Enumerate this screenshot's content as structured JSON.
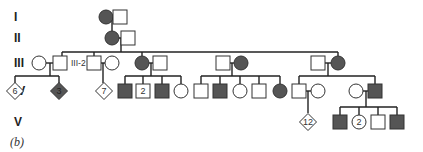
{
  "figure": {
    "panel_label": "(b)",
    "colors": {
      "affected": "#555555",
      "unaffected": "#ffffff",
      "stroke": "#333333",
      "line": "#222222"
    },
    "generations": [
      {
        "label": "I",
        "y": 17
      },
      {
        "label": "II",
        "y": 38
      },
      {
        "label": "III",
        "y": 63
      },
      {
        "label": "IV",
        "y": 91
      },
      {
        "label": "V",
        "y": 122
      }
    ],
    "individuals": [
      {
        "id": "I-1",
        "sex": "female",
        "affected": true,
        "x": 106,
        "y": 17
      },
      {
        "id": "I-2",
        "sex": "male",
        "affected": false,
        "x": 120,
        "y": 17
      },
      {
        "id": "II-1",
        "sex": "female",
        "affected": true,
        "x": 112,
        "y": 38
      },
      {
        "id": "II-2",
        "sex": "male",
        "affected": false,
        "x": 128,
        "y": 38
      },
      {
        "id": "III-1",
        "sex": "female",
        "affected": false,
        "x": 39,
        "y": 63
      },
      {
        "id": "III-2",
        "sex": "male",
        "affected": false,
        "x": 60,
        "y": 63,
        "label": "III-2"
      },
      {
        "id": "III-3",
        "sex": "male",
        "affected": false,
        "x": 94,
        "y": 63
      },
      {
        "id": "III-4",
        "sex": "female",
        "affected": false,
        "x": 112,
        "y": 63
      },
      {
        "id": "III-5",
        "sex": "female",
        "affected": true,
        "x": 142,
        "y": 63
      },
      {
        "id": "III-6",
        "sex": "male",
        "affected": false,
        "x": 160,
        "y": 63
      },
      {
        "id": "III-7",
        "sex": "male",
        "affected": false,
        "x": 223,
        "y": 63
      },
      {
        "id": "III-8",
        "sex": "female",
        "affected": true,
        "x": 241,
        "y": 63
      },
      {
        "id": "III-9",
        "sex": "male",
        "affected": false,
        "x": 318,
        "y": 63
      },
      {
        "id": "III-10",
        "sex": "female",
        "affected": true,
        "x": 338,
        "y": 63
      },
      {
        "id": "IV-a",
        "sex": "unknown",
        "affected": false,
        "x": 15,
        "y": 91,
        "count": "6"
      },
      {
        "id": "IV-b",
        "sex": "unknown",
        "affected": true,
        "x": 59,
        "y": 91,
        "count": "3"
      },
      {
        "id": "IV-c",
        "sex": "unknown",
        "affected": false,
        "x": 104,
        "y": 91,
        "count": "7"
      },
      {
        "id": "IV-d",
        "sex": "male",
        "affected": true,
        "x": 125,
        "y": 91
      },
      {
        "id": "IV-e",
        "sex": "male",
        "affected": false,
        "x": 143,
        "y": 91,
        "count": "2"
      },
      {
        "id": "IV-f",
        "sex": "male",
        "affected": true,
        "x": 162,
        "y": 91
      },
      {
        "id": "IV-g",
        "sex": "female",
        "affected": false,
        "x": 181,
        "y": 91
      },
      {
        "id": "IV-h",
        "sex": "male",
        "affected": false,
        "x": 201,
        "y": 91
      },
      {
        "id": "IV-i",
        "sex": "male",
        "affected": true,
        "x": 220,
        "y": 91
      },
      {
        "id": "IV-j",
        "sex": "female",
        "affected": false,
        "x": 240,
        "y": 91
      },
      {
        "id": "IV-k",
        "sex": "male",
        "affected": false,
        "x": 259,
        "y": 91
      },
      {
        "id": "IV-l",
        "sex": "female",
        "affected": true,
        "x": 280,
        "y": 91
      },
      {
        "id": "IV-m",
        "sex": "male",
        "affected": false,
        "x": 299,
        "y": 91
      },
      {
        "id": "IV-n",
        "sex": "female",
        "affected": false,
        "x": 318,
        "y": 91
      },
      {
        "id": "IV-o",
        "sex": "female",
        "affected": false,
        "x": 356,
        "y": 91
      },
      {
        "id": "IV-p",
        "sex": "male",
        "affected": true,
        "x": 375,
        "y": 91
      },
      {
        "id": "V-a",
        "sex": "unknown",
        "affected": false,
        "x": 308,
        "y": 122,
        "count": "12"
      },
      {
        "id": "V-b",
        "sex": "male",
        "affected": true,
        "x": 340,
        "y": 122
      },
      {
        "id": "V-c",
        "sex": "female",
        "affected": false,
        "x": 359,
        "y": 122,
        "count": "2"
      },
      {
        "id": "V-d",
        "sex": "male",
        "affected": false,
        "x": 378,
        "y": 122
      },
      {
        "id": "V-e",
        "sex": "male",
        "affected": true,
        "x": 397,
        "y": 122
      }
    ],
    "lines": [
      [
        113,
        17,
        114,
        17
      ],
      [
        112,
        17,
        112,
        31
      ],
      [
        119,
        38,
        121,
        38
      ],
      [
        121,
        38,
        121,
        52
      ],
      [
        62,
        52,
        338,
        52
      ],
      [
        62,
        52,
        62,
        56
      ],
      [
        94,
        52,
        94,
        56
      ],
      [
        142,
        52,
        142,
        56
      ],
      [
        338,
        52,
        338,
        56
      ],
      [
        46,
        63,
        53,
        63
      ],
      [
        50,
        63,
        50,
        76
      ],
      [
        15,
        76,
        59,
        76
      ],
      [
        15,
        76,
        15,
        83
      ],
      [
        59,
        76,
        59,
        83
      ],
      [
        101,
        63,
        105,
        63
      ],
      [
        103,
        63,
        103,
        83
      ],
      [
        149,
        63,
        153,
        63
      ],
      [
        151,
        63,
        151,
        76
      ],
      [
        125,
        76,
        181,
        76
      ],
      [
        125,
        76,
        125,
        84
      ],
      [
        143,
        76,
        143,
        84
      ],
      [
        162,
        76,
        162,
        84
      ],
      [
        181,
        76,
        181,
        84
      ],
      [
        230,
        63,
        234,
        63
      ],
      [
        232,
        63,
        232,
        76
      ],
      [
        201,
        76,
        280,
        76
      ],
      [
        201,
        76,
        201,
        84
      ],
      [
        220,
        76,
        220,
        84
      ],
      [
        240,
        76,
        240,
        84
      ],
      [
        259,
        76,
        259,
        84
      ],
      [
        280,
        76,
        280,
        84
      ],
      [
        325,
        63,
        331,
        63
      ],
      [
        328,
        63,
        328,
        76
      ],
      [
        299,
        76,
        375,
        76
      ],
      [
        299,
        76,
        299,
        84
      ],
      [
        375,
        76,
        375,
        84
      ],
      [
        306,
        91,
        311,
        91
      ],
      [
        308,
        91,
        308,
        113
      ],
      [
        363,
        91,
        368,
        91
      ],
      [
        366,
        91,
        366,
        107
      ],
      [
        340,
        107,
        397,
        107
      ],
      [
        340,
        107,
        340,
        115
      ],
      [
        359,
        107,
        359,
        115
      ],
      [
        378,
        107,
        378,
        115
      ],
      [
        397,
        107,
        397,
        115
      ]
    ]
  }
}
